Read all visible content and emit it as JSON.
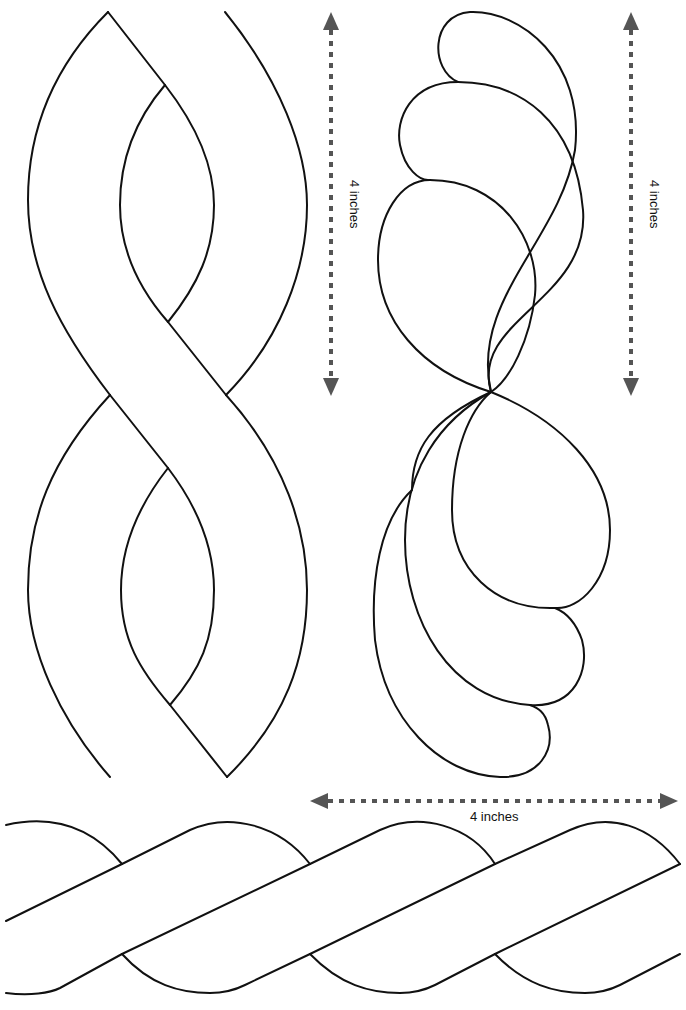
{
  "colors": {
    "line": "#111111",
    "dimension": "#555555",
    "background": "#ffffff"
  },
  "patterns": [
    {
      "id": "cable-vertical",
      "name": "Vertical twisted cable",
      "measurement": "4 inches"
    },
    {
      "id": "feather-vertical",
      "name": "Vertical feather plume",
      "measurement": "4 inches"
    },
    {
      "id": "rope-horizontal",
      "name": "Horizontal rope twist",
      "measurement": "4 inches"
    }
  ],
  "dimensions": {
    "left_vertical": {
      "label": "4 inches",
      "orientation": "vertical"
    },
    "right_vertical": {
      "label": "4 inches",
      "orientation": "vertical"
    },
    "bottom_horizontal": {
      "label": "4 inches",
      "orientation": "horizontal"
    }
  }
}
